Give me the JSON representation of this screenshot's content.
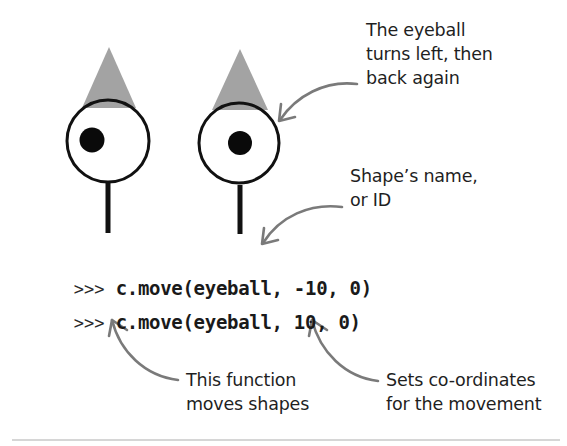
{
  "figure": {
    "colors": {
      "hat": "#a3a3a3",
      "outline": "#111111",
      "pupil": "#0a0a0a",
      "arrow": "#7a7a7a",
      "rule": "#d6d6d6",
      "background": "#ffffff"
    },
    "eyeballs": [
      {
        "name": "before",
        "state": "looking left",
        "hat": {
          "apex": [
            109,
            47
          ],
          "base_left": [
            82,
            108
          ],
          "base_right": [
            136,
            108
          ]
        },
        "eye": {
          "cx": 108,
          "cy": 141,
          "r": 42
        },
        "pupil": {
          "cx": 92,
          "cy": 140,
          "r": 13
        },
        "stick": {
          "x": 108,
          "y1": 184,
          "y2": 233
        }
      },
      {
        "name": "after",
        "state": "centered",
        "hat": {
          "apex": [
            240,
            49
          ],
          "base_left": [
            212,
            110
          ],
          "base_right": [
            268,
            110
          ]
        },
        "eye": {
          "cx": 239,
          "cy": 143,
          "r": 41
        },
        "pupil": {
          "cx": 240,
          "cy": 143,
          "r": 12
        },
        "stick": {
          "x": 240,
          "y1": 186,
          "y2": 234
        }
      }
    ]
  },
  "code": {
    "lines": [
      {
        "prompt": ">>>",
        "text": "c.move(eyeball, -10, 0)"
      },
      {
        "prompt": ">>>",
        "text": "c.move(eyeball, 10, 0)"
      }
    ]
  },
  "annotations": {
    "eyeball_turns": {
      "lines": [
        "The eyeball",
        "turns left, then",
        "back again"
      ]
    },
    "shape_name": {
      "lines": [
        "Shape’s name,",
        "or ID"
      ]
    },
    "function": {
      "lines": [
        "This function",
        "moves shapes"
      ]
    },
    "coordinates": {
      "lines": [
        "Sets co-ordinates",
        "for the movement"
      ]
    }
  }
}
